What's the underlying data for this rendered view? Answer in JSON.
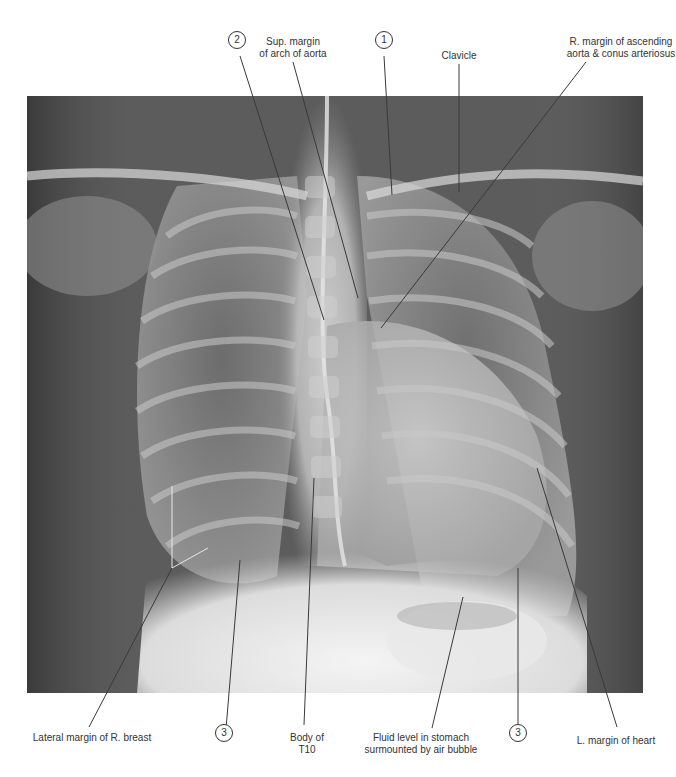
{
  "figure": {
    "image_box": {
      "x": 27,
      "y": 96,
      "width": 616,
      "height": 597
    }
  },
  "labels": [
    {
      "id": "sup-margin-arch-aorta",
      "lines": [
        "Sup. margin",
        "of arch of aorta"
      ],
      "x": 293,
      "y": 36,
      "leader": [
        [
          293,
          62
        ],
        [
          358,
          298
        ]
      ]
    },
    {
      "id": "clavicle",
      "lines": [
        "Clavicle"
      ],
      "x": 459,
      "y": 50,
      "leader": [
        [
          459,
          64
        ],
        [
          459,
          192
        ]
      ]
    },
    {
      "id": "r-margin-ascending-aorta",
      "lines": [
        "R. margin of ascending",
        "aorta & conus arteriosus"
      ],
      "x": 621,
      "y": 36,
      "leader": [
        [
          586,
          62
        ],
        [
          381,
          328
        ]
      ]
    },
    {
      "id": "lateral-margin-r-breast",
      "lines": [
        "Lateral margin of R. breast"
      ],
      "x": 92,
      "y": 732,
      "leader": [
        [
          89,
          727
        ],
        [
          172,
          568
        ]
      ]
    },
    {
      "id": "body-of-t10",
      "lines": [
        "Body of",
        "T10"
      ],
      "x": 307,
      "y": 732,
      "leader": [
        [
          304,
          725
        ],
        [
          314,
          478
        ]
      ]
    },
    {
      "id": "fluid-level-stomach",
      "lines": [
        "Fluid level in stomach",
        "surmounted by air bubble"
      ],
      "x": 421,
      "y": 732,
      "leader": [
        [
          432,
          728
        ],
        [
          463,
          597
        ]
      ]
    },
    {
      "id": "l-margin-of-heart",
      "lines": [
        "L. margin of heart"
      ],
      "x": 616,
      "y": 735,
      "leader": [
        [
          617,
          727
        ],
        [
          537,
          468
        ]
      ]
    }
  ],
  "breast_branch": {
    "from": [
      172,
      568
    ],
    "to_a": [
      172,
      486
    ],
    "to_b": [
      208,
      548
    ]
  },
  "callouts": [
    {
      "id": "callout-1",
      "number": "1",
      "x": 384,
      "y": 39,
      "leader": [
        [
          384,
          56
        ],
        [
          392,
          195
        ]
      ]
    },
    {
      "id": "callout-2",
      "number": "2",
      "x": 237,
      "y": 39,
      "leader": [
        [
          240,
          56
        ],
        [
          324,
          320
        ]
      ]
    },
    {
      "id": "callout-3-left",
      "number": "3",
      "x": 224,
      "y": 732,
      "leader": [
        [
          226,
          729
        ],
        [
          240,
          560
        ]
      ]
    },
    {
      "id": "callout-3-right",
      "number": "3",
      "x": 518,
      "y": 732,
      "leader": [
        [
          518,
          729
        ],
        [
          518,
          568
        ]
      ]
    }
  ]
}
